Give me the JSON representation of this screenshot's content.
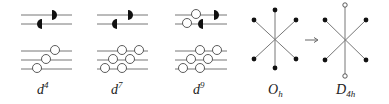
{
  "figure": {
    "panels": [
      {
        "id": "d4",
        "label": "d",
        "superscript": "4",
        "upper_levels": {
          "filled_half_arrows": 2,
          "open_circles": 0
        },
        "lower_levels": {
          "open_circles": 3
        }
      },
      {
        "id": "d7",
        "label": "d",
        "superscript": "7",
        "upper_levels": {
          "filled_half_arrows": 2,
          "open_circles": 0
        },
        "lower_levels": {
          "open_circles": 6
        }
      },
      {
        "id": "d9",
        "label": "d",
        "superscript": "9",
        "upper_levels": {
          "filled_half_arrows": 2,
          "open_circles": 2
        },
        "lower_levels": {
          "open_circles": 6
        }
      }
    ],
    "geometries": [
      {
        "id": "oh",
        "label": "O",
        "subscript": "h",
        "ligands": "6 filled"
      },
      {
        "id": "d4h",
        "label": "D",
        "subscript": "4h",
        "ligands": "4 filled equatorial, 2 open axial"
      }
    ],
    "arrow": "→",
    "colors": {
      "line": "#777777",
      "fill": "#111111",
      "text": "#222222"
    }
  }
}
